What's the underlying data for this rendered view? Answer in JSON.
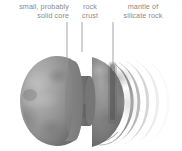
{
  "figure": {
    "background_color": "#ffffff",
    "label_color": "#8a8a8a",
    "leader_line_color": "#9b9b9b"
  },
  "labels": {
    "core": "small, probably\nsolid core",
    "crust": "rock\ncrust",
    "mantle": "mantle of\nsilicate rock",
    "cropped_left": "ve"
  },
  "leader_lines": [
    {
      "name": "core-leader",
      "x": 67,
      "y1": 22,
      "y2": 66
    },
    {
      "name": "crust-leader",
      "x": 82,
      "y1": 22,
      "y2": 52
    },
    {
      "name": "mantle-leader",
      "x": 113,
      "y1": 22,
      "y2": 71
    }
  ],
  "structure": {
    "outer_sphere_color": "#9a9a9a",
    "cut_face_color": "#8e8e8e",
    "core_color": "#6e6e6e",
    "mantle_color": "#7c7c7c",
    "outer_shell_colors": [
      "#8d8d8d",
      "#b0b0b0",
      "#c9c9c9",
      "#dedede",
      "#efefef"
    ],
    "layer_count": 5
  }
}
